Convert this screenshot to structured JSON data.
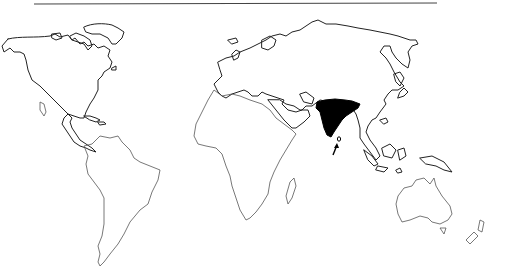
{
  "map": {
    "type": "world outline map",
    "style": "black-and-white line drawing",
    "highlighted_region": {
      "name": "India",
      "fill_color": "#000000"
    },
    "arrow": {
      "points_to": "Sri Lanka",
      "color": "#000000"
    },
    "line_color": "#222222",
    "background_color": "#ffffff",
    "continents": [
      "North America",
      "South America",
      "Europe",
      "Africa",
      "Asia",
      "Australia"
    ]
  }
}
